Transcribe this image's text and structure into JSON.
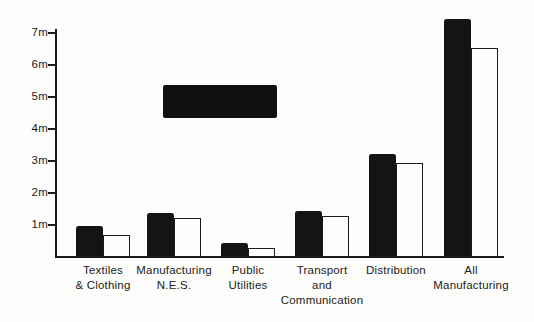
{
  "figure": {
    "background_color": "#fdfdfb",
    "ink_color": "#1b1b1b"
  },
  "chart_data": {
    "type": "bar",
    "title": "",
    "xlabel": "",
    "ylabel": "",
    "unit": "m",
    "categories": [
      "Textiles\n& Clothing",
      "Manufacturing\nN.E.S.",
      "Public\nUtilities",
      "Transport\nand\nCommunication",
      "Distribution",
      "All\nManufacturing"
    ],
    "series": [
      {
        "name": "black-filled-bars",
        "style": "solid",
        "color": "#141414",
        "values": [
          0.95,
          1.35,
          0.4,
          1.4,
          3.2,
          7.4
        ]
      },
      {
        "name": "white-outlined-bars",
        "style": "outline",
        "color": "#fdfdfb",
        "values": [
          0.65,
          1.2,
          0.25,
          1.25,
          2.9,
          6.5
        ]
      }
    ],
    "ytick_labels": [
      "1m",
      "2m",
      "3m",
      "4m",
      "5m",
      "6m",
      "7m"
    ],
    "ylim": [
      0,
      7.5
    ],
    "grid": false,
    "legend_position": "none",
    "annotations": [
      {
        "name": "unlabeled-black-block",
        "text": "",
        "y_from": 4.3,
        "y_to": 5.35,
        "note": "solid black rectangle floating above the Manufacturing N.E.S. and Public Utilities columns (appears to be a redacted legend/label)"
      }
    ]
  }
}
